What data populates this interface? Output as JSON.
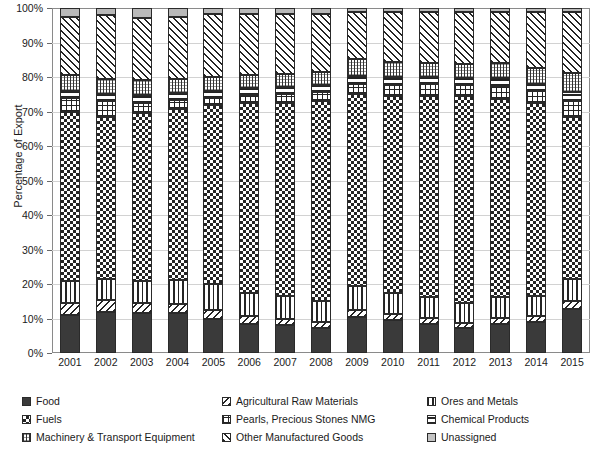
{
  "chart_data": {
    "type": "bar",
    "subtype": "stacked-bar-100-percent",
    "title": "",
    "xlabel": "",
    "ylabel": "Percentage of Export",
    "ylim": [
      0,
      100
    ],
    "ytick_labels": [
      "0%",
      "10%",
      "20%",
      "30%",
      "40%",
      "50%",
      "60%",
      "70%",
      "80%",
      "90%",
      "100%"
    ],
    "ytick_values": [
      0,
      10,
      20,
      30,
      40,
      50,
      60,
      70,
      80,
      90,
      100
    ],
    "grid": true,
    "legend_position": "bottom",
    "categories": [
      "2001",
      "2002",
      "2003",
      "2004",
      "2005",
      "2006",
      "2007",
      "2008",
      "2009",
      "2010",
      "2011",
      "2012",
      "2013",
      "2014",
      "2015"
    ],
    "series": [
      {
        "name": "Food",
        "pattern": "solid-dark",
        "values": [
          11.0,
          12.0,
          11.5,
          11.5,
          9.8,
          8.5,
          8.0,
          7.2,
          10.5,
          9.5,
          8.5,
          7.2,
          8.5,
          9.0,
          12.8
        ]
      },
      {
        "name": "Agricultural Raw Materials",
        "pattern": "diagonal-hatch-down",
        "values": [
          3.5,
          3.5,
          3.0,
          2.8,
          2.6,
          2.2,
          2.0,
          1.8,
          2.0,
          1.8,
          1.6,
          1.5,
          1.6,
          1.6,
          2.2
        ]
      },
      {
        "name": "Ores and Metals",
        "pattern": "vertical-lines",
        "values": [
          6.5,
          6.0,
          6.5,
          7.0,
          7.5,
          6.8,
          6.5,
          6.0,
          7.0,
          6.2,
          6.0,
          5.8,
          6.0,
          5.8,
          6.5
        ]
      },
      {
        "name": "Fuels",
        "pattern": "checkerboard",
        "values": [
          49.0,
          47.0,
          48.5,
          49.5,
          52.0,
          55.0,
          56.0,
          58.0,
          55.5,
          57.0,
          58.5,
          60.0,
          57.5,
          56.0,
          47.0
        ]
      },
      {
        "name": "Pearls, Precious Stones NMG",
        "pattern": "grid-crosshatch",
        "values": [
          4.0,
          4.5,
          3.0,
          2.5,
          2.0,
          2.2,
          2.5,
          2.6,
          3.0,
          3.2,
          3.5,
          3.2,
          3.8,
          3.5,
          4.5
        ]
      },
      {
        "name": "Chemical Products",
        "pattern": "horizontal-lines",
        "values": [
          2.0,
          2.0,
          2.2,
          2.2,
          2.0,
          2.0,
          2.0,
          2.0,
          2.2,
          2.2,
          2.0,
          2.0,
          2.2,
          2.2,
          2.8
        ]
      },
      {
        "name": "Machinery & Transport Equipment",
        "pattern": "fine-vertical-grid",
        "values": [
          4.5,
          4.5,
          4.5,
          4.0,
          4.0,
          4.0,
          4.0,
          4.0,
          5.0,
          4.5,
          4.0,
          4.0,
          4.5,
          4.5,
          5.5
        ]
      },
      {
        "name": "Other Manufactured Goods",
        "pattern": "diagonal-hatch-up",
        "values": [
          17.0,
          18.5,
          18.0,
          18.0,
          18.5,
          17.5,
          17.2,
          16.6,
          13.8,
          14.6,
          14.9,
          15.3,
          14.9,
          16.4,
          17.7
        ]
      },
      {
        "name": "Unassigned",
        "pattern": "solid-light-gray",
        "values": [
          2.5,
          2.0,
          2.8,
          2.5,
          1.6,
          1.8,
          1.8,
          1.8,
          1.0,
          1.0,
          1.0,
          1.0,
          1.0,
          1.0,
          1.0
        ]
      }
    ]
  },
  "legend": {
    "items": [
      {
        "label": "Food",
        "swatch": "food-swatch"
      },
      {
        "label": "Agricultural Raw Materials",
        "swatch": "agricultural-raw-materials-swatch"
      },
      {
        "label": "Ores and Metals",
        "swatch": "ores-and-metals-swatch"
      },
      {
        "label": "Fuels",
        "swatch": "fuels-swatch"
      },
      {
        "label": "Pearls, Precious Stones NMG",
        "swatch": "pearls-swatch"
      },
      {
        "label": "Chemical Products",
        "swatch": "chemical-products-swatch"
      },
      {
        "label": "Machinery & Transport Equipment",
        "swatch": "machinery-swatch"
      },
      {
        "label": "Other Manufactured Goods",
        "swatch": "other-manufactured-goods-swatch"
      },
      {
        "label": "Unassigned",
        "swatch": "unassigned-swatch"
      }
    ]
  },
  "colors": {
    "dark": "#3a3a3a",
    "light_gray": "#b9b9b9",
    "gridline": "#d2d2d2",
    "axis": "#8a8a8a",
    "text": "#1a1a1a",
    "background": "#ffffff"
  }
}
